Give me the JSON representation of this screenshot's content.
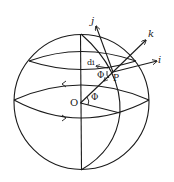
{
  "figure": {
    "labels": {
      "j": "j",
      "k": "k",
      "i": "i",
      "di": "di",
      "phi_at_p": "Φ",
      "p": "P",
      "o": "O",
      "phi_at_o": "Φ"
    },
    "colors": {
      "ink": "#1a1a1a",
      "background": "#ffffff"
    }
  }
}
